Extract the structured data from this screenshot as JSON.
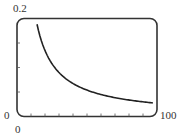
{
  "chart_data": {
    "type": "line",
    "title": "",
    "xlabel": "",
    "ylabel": "",
    "xlim": [
      0,
      100
    ],
    "ylim": [
      0,
      0.2
    ],
    "x_tick_labels": [
      "0",
      "100"
    ],
    "y_tick_labels": [
      "0",
      "0.2"
    ],
    "x_minor_ticks": 9,
    "y_minor_ticks": 3,
    "grid": false,
    "legend": null,
    "series": [
      {
        "name": "curve",
        "x": [
          14.3,
          20,
          25,
          30.7,
          41.4,
          55.7,
          73.6,
          97
        ],
        "y": [
          0.194,
          0.136,
          0.105,
          0.085,
          0.064,
          0.047,
          0.037,
          0.029
        ]
      }
    ]
  },
  "labels": {
    "y_max": "0.2",
    "y_min": "0",
    "x_min": "0",
    "x_max": "100"
  },
  "colors": {
    "frame": "#333333",
    "curve": "#222222"
  }
}
